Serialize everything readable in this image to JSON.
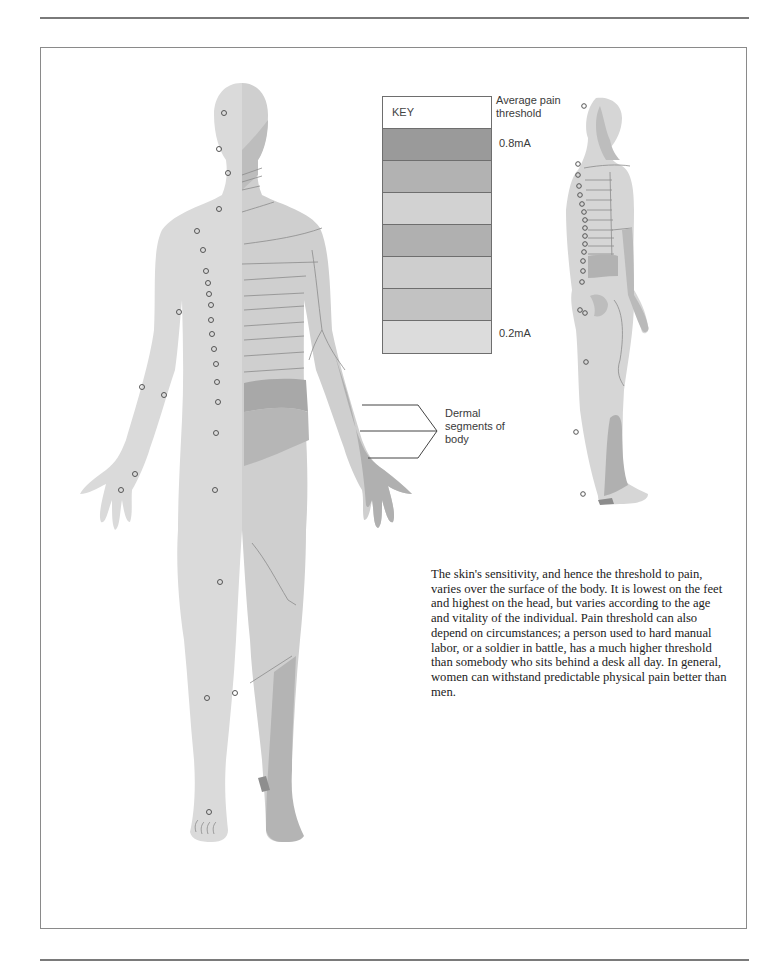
{
  "page": {
    "rules": {
      "top_y": 18,
      "bottom_y": 960
    }
  },
  "key": {
    "head_label": "KEY",
    "title": "Average pain threshold",
    "max_label": "0.8mA",
    "min_label": "0.2mA",
    "bands": [
      {
        "shade": "#9a9a9a"
      },
      {
        "shade": "#b2b2b2"
      },
      {
        "shade": "#d2d2d2"
      },
      {
        "shade": "#b0b0b0"
      },
      {
        "shade": "#cecece"
      },
      {
        "shade": "#c2c2c2"
      },
      {
        "shade": "#dcdcdc"
      }
    ]
  },
  "callout": {
    "label": "Dermal segments of body"
  },
  "caption": {
    "text": "The skin's sensitivity, and hence the threshold to pain, varies over the surface of the body. It is lowest on the feet and highest on the head, but varies according to the age and vitality of the individual. Pain threshold can also depend on circumstances; a person used to hard manual labor, or a soldier in battle, has a much higher threshold than somebody who sits behind a desk all day. In general, women can withstand predictable physical pain better than men."
  },
  "colors": {
    "body_base": "#dadada",
    "body_right_half": "#cfcfcf",
    "segment_dark": "#a8a8a8",
    "segment_mid": "#bdbdbd",
    "segment_line": "#8c8c8c",
    "point_stroke": "#555555"
  }
}
